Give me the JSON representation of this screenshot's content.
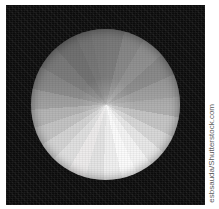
{
  "image": {
    "subject": "folded paper disc",
    "description": "Close-up photograph of a radially pleated circular paper fan on a black background",
    "background_color": "#0b0b0b",
    "page_background": "#ffffff"
  },
  "disc": {
    "shape": "circle",
    "center_x": 105,
    "center_y": 104,
    "radius": 75,
    "facet_count": 24,
    "brightest_color": "#fbfbfb",
    "darkest_color": "#818181"
  },
  "watermark": {
    "credit": "esbsauda/Shutterstock.com",
    "color": "#5a5a5a",
    "orientation": "vertical"
  }
}
